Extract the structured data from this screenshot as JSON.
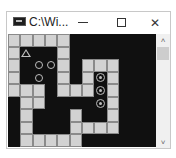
{
  "window": {
    "title": "C:\\Wi...",
    "controls": {
      "minimize": "—",
      "maximize": "☐",
      "close": "✕"
    }
  },
  "game": {
    "cols": 12,
    "rows": 9,
    "grid": [
      "LLLLLDDDDDDD",
      "LDDDLDDDDDDD",
      "LDDDLDLLLDDD",
      "LDDDLDLDLDDD",
      "LLLDLLLDLDDD",
      "DLLDDDDDLDDD",
      "DLDDDLDDLDDD",
      "DLDDDLLLLDDD",
      "DLLLLLDDDDDD"
    ],
    "player": {
      "row": 1,
      "col": 1,
      "icon": "triangle"
    },
    "boxes": [
      {
        "row": 2,
        "col": 2
      },
      {
        "row": 2,
        "col": 3
      },
      {
        "row": 3,
        "col": 2
      }
    ],
    "targets": [
      {
        "row": 3,
        "col": 7
      },
      {
        "row": 4,
        "col": 7
      },
      {
        "row": 5,
        "col": 7
      }
    ]
  },
  "scrollbar": {
    "up": "˄",
    "down": "˅"
  },
  "colors": {
    "wall": "#d2d2d2",
    "floor": "#101010",
    "piece": "#bdbdbd"
  }
}
